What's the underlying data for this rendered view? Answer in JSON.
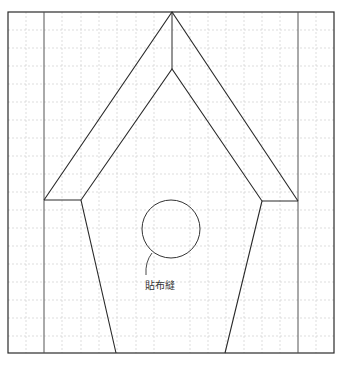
{
  "diagram": {
    "applique_label": "貼布縫",
    "colors": {
      "line": "#2a2a2a",
      "grid": "#cfcfcf",
      "background": "#ffffff"
    },
    "grid": {
      "cell_size": 18.2,
      "columns": 18,
      "rows": 19
    }
  }
}
